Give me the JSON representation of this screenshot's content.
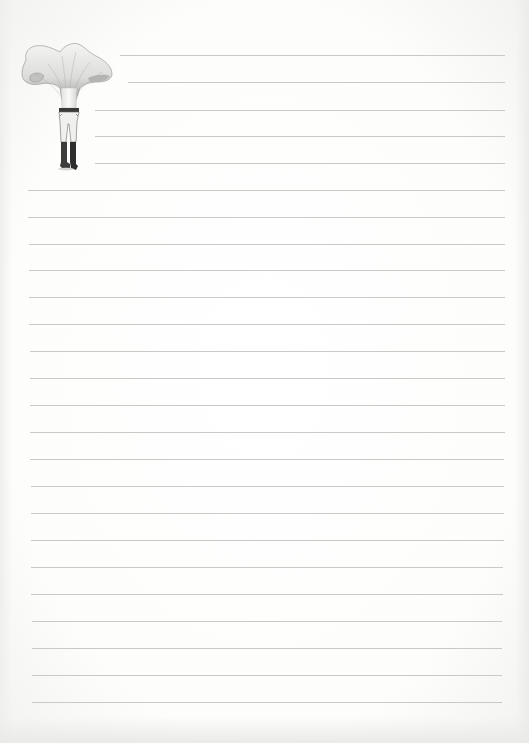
{
  "page": {
    "type": "lined-notepaper",
    "background_color": "#fbfbfa",
    "line_color": "#c9c9c7"
  },
  "illustration": {
    "subject": "mushroom-headed-figure",
    "description": "Vintage engraving of a chanterelle mushroom cap atop a standing figure in trousers and boots",
    "colors": {
      "cap": "#e6e6e4",
      "cap_shade": "#9a9a98",
      "legs": "#efefed",
      "belt": "#3a3a3a",
      "boots": "#3c3c3c"
    }
  },
  "lines": {
    "short": [
      {
        "y": 55,
        "x1": 120,
        "x2": 505
      },
      {
        "y": 82,
        "x1": 128,
        "x2": 505
      },
      {
        "y": 110,
        "x1": 95,
        "x2": 505
      },
      {
        "y": 136,
        "x1": 95,
        "x2": 505
      },
      {
        "y": 163,
        "x1": 95,
        "x2": 505
      }
    ],
    "full": [
      {
        "y": 190,
        "x1": 28,
        "x2": 505
      },
      {
        "y": 217,
        "x1": 28,
        "x2": 505
      },
      {
        "y": 244,
        "x1": 29,
        "x2": 505
      },
      {
        "y": 270,
        "x1": 29,
        "x2": 505
      },
      {
        "y": 297,
        "x1": 29,
        "x2": 505
      },
      {
        "y": 324,
        "x1": 29,
        "x2": 505
      },
      {
        "y": 351,
        "x1": 30,
        "x2": 505
      },
      {
        "y": 378,
        "x1": 30,
        "x2": 505
      },
      {
        "y": 405,
        "x1": 30,
        "x2": 505
      },
      {
        "y": 432,
        "x1": 30,
        "x2": 505
      },
      {
        "y": 459,
        "x1": 30,
        "x2": 504
      },
      {
        "y": 486,
        "x1": 31,
        "x2": 504
      },
      {
        "y": 513,
        "x1": 31,
        "x2": 504
      },
      {
        "y": 540,
        "x1": 31,
        "x2": 504
      },
      {
        "y": 567,
        "x1": 31,
        "x2": 503
      },
      {
        "y": 594,
        "x1": 31,
        "x2": 503
      },
      {
        "y": 621,
        "x1": 32,
        "x2": 502
      },
      {
        "y": 648,
        "x1": 32,
        "x2": 502
      },
      {
        "y": 675,
        "x1": 32,
        "x2": 502
      },
      {
        "y": 702,
        "x1": 32,
        "x2": 502
      }
    ]
  }
}
